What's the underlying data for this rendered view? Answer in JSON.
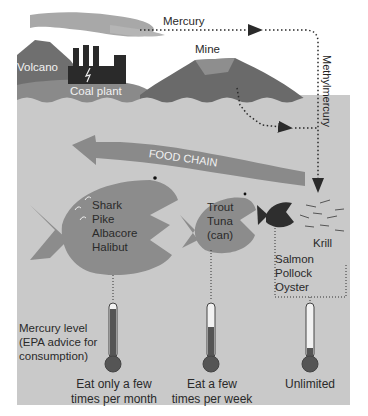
{
  "diagram": {
    "sources": {
      "volcano": "Volcano",
      "coal_plant": "Coal plant",
      "mine": "Mine"
    },
    "flows": {
      "mercury": "Mercury",
      "methylmercury": "Methylmercury",
      "food_chain": "FOOD CHAIN"
    },
    "fish_groups": [
      {
        "names": [
          "Shark",
          "Pike",
          "Albacore",
          "Halibut"
        ],
        "advice": "Eat only a few times per month",
        "advice_lines": [
          "Eat only a few",
          "times per month"
        ],
        "mercury_fill_pct": 90
      },
      {
        "names": [
          "Trout",
          "Tuna",
          "(can)"
        ],
        "advice": "Eat a few times per week",
        "advice_lines": [
          "Eat a few",
          "times per week"
        ],
        "mercury_fill_pct": 60
      },
      {
        "names": [
          "Salmon",
          "Pollock",
          "Oyster"
        ],
        "advice": "Unlimited",
        "advice_lines": [
          "Unlimited"
        ],
        "mercury_fill_pct": 15
      }
    ],
    "krill_label": "Krill",
    "legend": {
      "lines": [
        "Mercury level",
        "(EPA advice for",
        "consumption)"
      ]
    },
    "colors": {
      "background": "#ffffff",
      "water": "#c9c9c9",
      "sky_smoke": "#a8a8a8",
      "land": "#7a7a7a",
      "fish": "#8c8c8c",
      "dark_fish": "#2e2e2e",
      "arrow": "#8a8a8a",
      "mercury_fill": "#555555"
    }
  }
}
